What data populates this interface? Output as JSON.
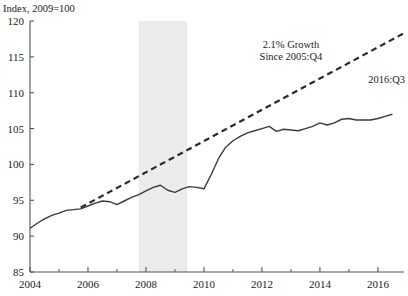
{
  "chart_data": {
    "type": "line",
    "title": "",
    "ylabel": "Index, 2009=100",
    "xlabel": "",
    "ylim": [
      85,
      120
    ],
    "yticks": [
      85,
      90,
      95,
      100,
      105,
      110,
      115,
      120
    ],
    "ytick_labels": [
      "85",
      "90",
      "95",
      "100",
      "105",
      "110",
      "115",
      "120"
    ],
    "xlim": [
      2004.0,
      2016.9
    ],
    "xticks": [
      2004,
      2006,
      2008,
      2010,
      2012,
      2014,
      2016
    ],
    "xtick_labels": [
      "2004",
      "2006",
      "2008",
      "2010",
      "2012",
      "2014",
      "2016"
    ],
    "minor_xticks": [
      2005,
      2007,
      2009,
      2011,
      2013,
      2015
    ],
    "grid": false,
    "legend": "none",
    "annotations": [
      {
        "name": "growth-annotation-line1",
        "text": "2.1% Growth",
        "x": 2013.0,
        "y": 116.2
      },
      {
        "name": "growth-annotation-line2",
        "text": "Since 2005:Q4",
        "x": 2013.0,
        "y": 114.6
      },
      {
        "name": "endpoint-annotation",
        "text": "2016:Q3",
        "x": 2016.3,
        "y": 111.4
      }
    ],
    "shaded_region": {
      "name": "recession-band",
      "label": "Recession 2007:Q4-2009:Q2",
      "x_start": 2007.75,
      "x_end": 2009.42,
      "color": "#ebebeb"
    },
    "series": [
      {
        "name": "index-series",
        "style": "solid",
        "color": "#3b3b3b",
        "x": [
          2004.0,
          2004.25,
          2004.5,
          2004.75,
          2005.0,
          2005.25,
          2005.5,
          2005.75,
          2006.0,
          2006.25,
          2006.5,
          2006.75,
          2007.0,
          2007.25,
          2007.5,
          2007.75,
          2008.0,
          2008.25,
          2008.5,
          2008.75,
          2009.0,
          2009.25,
          2009.5,
          2009.75,
          2010.0,
          2010.25,
          2010.5,
          2010.75,
          2011.0,
          2011.25,
          2011.5,
          2011.75,
          2012.0,
          2012.25,
          2012.5,
          2012.75,
          2013.0,
          2013.25,
          2013.5,
          2013.75,
          2014.0,
          2014.25,
          2014.5,
          2014.75,
          2015.0,
          2015.25,
          2015.5,
          2015.75,
          2016.0,
          2016.25,
          2016.5
        ],
        "y": [
          91.1,
          91.8,
          92.4,
          92.9,
          93.2,
          93.6,
          93.7,
          93.8,
          94.2,
          94.6,
          94.9,
          94.8,
          94.4,
          94.9,
          95.4,
          95.8,
          96.3,
          96.8,
          97.1,
          96.4,
          96.1,
          96.6,
          96.9,
          96.8,
          96.6,
          98.6,
          100.8,
          102.4,
          103.3,
          103.9,
          104.4,
          104.7,
          105.0,
          105.3,
          104.6,
          104.9,
          104.8,
          104.7,
          105.0,
          105.3,
          105.8,
          105.5,
          105.8,
          106.3,
          106.4,
          106.2,
          106.2,
          106.2,
          106.4,
          106.7,
          107.0
        ]
      },
      {
        "name": "trend-line",
        "style": "dashed",
        "color": "#2b2b2b",
        "label": "2.1% Growth Since 2005:Q4",
        "growth_rate_pct": 2.1,
        "x": [
          2005.75,
          2016.9
        ],
        "y": [
          94.0,
          118.3
        ]
      }
    ]
  }
}
